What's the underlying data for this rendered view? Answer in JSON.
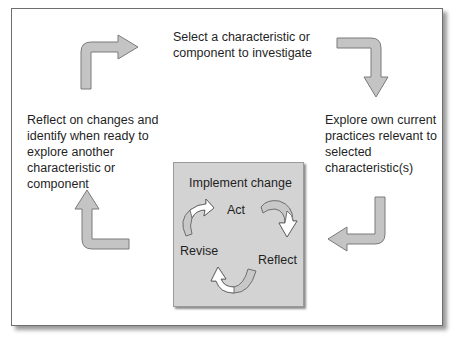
{
  "diagram": {
    "steps": [
      {
        "id": "select",
        "text": "Select a characteristic or component to investigate"
      },
      {
        "id": "explore",
        "text": "Explore own current practices relevant to selected characteristic(s)"
      },
      {
        "id": "reflect",
        "text": "Reflect on changes and identify when ready to explore another characteristic or component"
      }
    ],
    "implement": {
      "title": "Implement change",
      "cycle": [
        "Act",
        "Reflect",
        "Revise"
      ]
    },
    "colors": {
      "arrow_fill": "#c4c4c4",
      "arrow_stroke": "#7a7a7a",
      "inner_box": "#d3d3d3",
      "frame_border": "#6e6e6e"
    }
  }
}
